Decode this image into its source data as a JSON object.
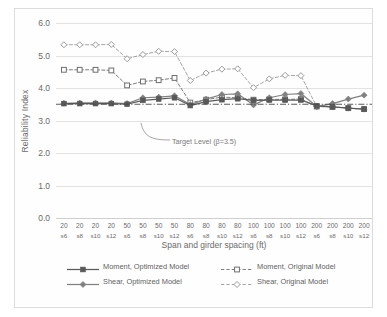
{
  "chart_data": {
    "type": "line",
    "title": "",
    "xlabel": "Span and girder spacing (ft)",
    "ylabel": "Reliability Index",
    "ylim": [
      0.0,
      6.0
    ],
    "ytick_labels": [
      "0.0",
      "1.0",
      "2.0",
      "3.0",
      "4.0",
      "5.0",
      "6.0"
    ],
    "ytick_values": [
      0.0,
      1.0,
      2.0,
      3.0,
      4.0,
      5.0,
      6.0
    ],
    "grid": true,
    "legend_position": "bottom",
    "categories": [
      "20 s6",
      "20 s8",
      "20 s10",
      "20 s12",
      "50 s6",
      "50 s8",
      "50 s10",
      "50 s12",
      "80 s6",
      "80 s8",
      "80 s10",
      "80 s12",
      "100 s6",
      "100 s8",
      "100 s10",
      "100 s12",
      "200 s6",
      "200 s8",
      "200 s10",
      "200 s12"
    ],
    "category_spans": [
      "20",
      "20",
      "20",
      "20",
      "50",
      "50",
      "50",
      "50",
      "80",
      "80",
      "80",
      "80",
      "100",
      "100",
      "100",
      "100",
      "200",
      "200",
      "200",
      "200"
    ],
    "category_spacings": [
      "s6",
      "s8",
      "s10",
      "s12",
      "s6",
      "s8",
      "s10",
      "s12",
      "s6",
      "s8",
      "s10",
      "s12",
      "s6",
      "s8",
      "s10",
      "s12",
      "s6",
      "s8",
      "s10",
      "s12"
    ],
    "series": [
      {
        "name": "Moment, Optimized Model",
        "style": "solid",
        "marker": "filled-square",
        "color": "#595959",
        "values": [
          3.52,
          3.52,
          3.52,
          3.52,
          3.5,
          3.62,
          3.66,
          3.7,
          3.46,
          3.58,
          3.64,
          3.67,
          3.62,
          3.63,
          3.63,
          3.63,
          3.45,
          3.42,
          3.38,
          3.35
        ]
      },
      {
        "name": "Shear, Optimized Model",
        "style": "solid",
        "marker": "filled-diamond",
        "color": "#808080",
        "values": [
          3.53,
          3.54,
          3.54,
          3.54,
          3.52,
          3.7,
          3.72,
          3.76,
          3.49,
          3.66,
          3.8,
          3.82,
          3.48,
          3.7,
          3.8,
          3.83,
          3.43,
          3.52,
          3.66,
          3.78
        ]
      },
      {
        "name": "Moment, Original Model",
        "style": "dashed",
        "marker": "open-square",
        "color": "#6e6e6e",
        "values": [
          4.56,
          4.56,
          4.56,
          4.54,
          4.08,
          4.2,
          4.24,
          4.31,
          3.55,
          3.64,
          3.72,
          3.7,
          3.64,
          3.65,
          3.65,
          3.66,
          3.43,
          3.42,
          3.38,
          3.35
        ]
      },
      {
        "name": "Shear, Original Model",
        "style": "dashed",
        "marker": "open-diamond",
        "color": "#9a9a9a",
        "values": [
          5.33,
          5.33,
          5.33,
          5.34,
          4.9,
          5.03,
          5.13,
          5.12,
          4.23,
          4.46,
          4.58,
          4.59,
          4.01,
          4.28,
          4.39,
          4.38,
          3.43,
          3.42,
          3.38,
          3.35
        ]
      }
    ],
    "reference_line": {
      "label": "Target Level (β=3.5)",
      "value": 3.5,
      "style": "dash-dot",
      "color": "#4a4a4a"
    }
  },
  "legend": {
    "items": [
      {
        "label": "Moment, Optimized Model"
      },
      {
        "label": "Shear, Optimized Model"
      },
      {
        "label": "Moment, Original Model"
      },
      {
        "label": "Shear, Original Model"
      }
    ]
  }
}
